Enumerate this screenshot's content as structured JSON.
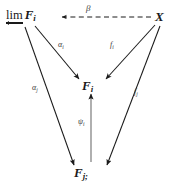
{
  "diagram": {
    "type": "commutative-diagram",
    "background_color": "#ffffff",
    "ink_color": "#1a1a1a",
    "nodes": [
      {
        "id": "lim",
        "label": "F",
        "subscript": "i",
        "prefix": "lim",
        "prefix_style": "underline-left-arrow",
        "position": "top-left"
      },
      {
        "id": "x",
        "label": "X",
        "subscript": "",
        "prefix": "",
        "prefix_style": "none",
        "position": "top-right"
      },
      {
        "id": "fi",
        "label": "F",
        "subscript": "i",
        "prefix": "",
        "prefix_style": "none",
        "position": "center"
      },
      {
        "id": "fj",
        "label": "F",
        "subscript": "j;",
        "prefix": "",
        "prefix_style": "none",
        "position": "bottom-center"
      }
    ],
    "edges": [
      {
        "id": "beta",
        "label": "β",
        "subscript": "",
        "from": "x",
        "to": "lim",
        "style": "dashed",
        "arrowhead": "to"
      },
      {
        "id": "alphai",
        "label": "α",
        "subscript": "i",
        "from": "lim",
        "to": "fi",
        "style": "solid",
        "arrowhead": "to"
      },
      {
        "id": "alphaj",
        "label": "α",
        "subscript": "j",
        "from": "lim",
        "to": "fj",
        "style": "solid",
        "arrowhead": "to"
      },
      {
        "id": "fi_map",
        "label": "f",
        "subscript": "i",
        "from": "x",
        "to": "fi",
        "style": "solid",
        "arrowhead": "to"
      },
      {
        "id": "fj_map",
        "label": "f",
        "subscript": "j",
        "from": "x",
        "to": "fj",
        "style": "solid",
        "arrowhead": "to"
      },
      {
        "id": "psi",
        "label": "ψ",
        "subscript": "i",
        "from": "fj",
        "to": "fi",
        "style": "solid",
        "arrowhead": "to"
      }
    ]
  }
}
